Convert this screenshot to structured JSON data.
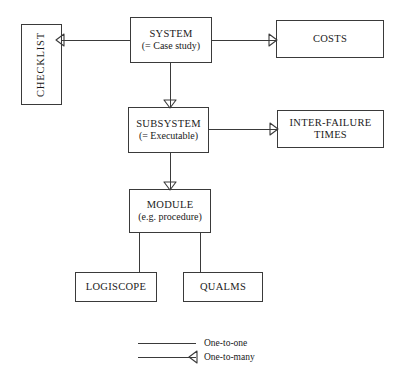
{
  "diagram": {
    "nodes": [
      {
        "id": "checklist",
        "label": "CHECKLIST",
        "sublabel": "",
        "orientation": "vertical",
        "x": 21,
        "y": 24,
        "w": 41,
        "h": 81
      },
      {
        "id": "system",
        "label": "SYSTEM",
        "sublabel": "(= Case study)",
        "orientation": "horizontal",
        "x": 130,
        "y": 17,
        "w": 82,
        "h": 46
      },
      {
        "id": "costs",
        "label": "COSTS",
        "sublabel": "",
        "orientation": "horizontal",
        "x": 276,
        "y": 20,
        "w": 108,
        "h": 38
      },
      {
        "id": "subsystem",
        "label": "SUBSYSTEM",
        "sublabel": "(= Executable)",
        "orientation": "horizontal",
        "x": 128,
        "y": 107,
        "w": 81,
        "h": 46
      },
      {
        "id": "inter-failure-times",
        "label": "INTER-FAILURE",
        "sublabel": "TIMES",
        "orientation": "horizontal",
        "x": 277,
        "y": 110,
        "w": 107,
        "h": 38
      },
      {
        "id": "module",
        "label": "MODULE",
        "sublabel": "(e.g. procedure)",
        "orientation": "horizontal",
        "x": 129,
        "y": 189,
        "w": 82,
        "h": 44
      },
      {
        "id": "logiscope",
        "label": "LOGISCOPE",
        "sublabel": "",
        "orientation": "horizontal",
        "x": 75,
        "y": 272,
        "w": 82,
        "h": 30
      },
      {
        "id": "qualms",
        "label": "QUALMS",
        "sublabel": "",
        "orientation": "horizontal",
        "x": 183,
        "y": 272,
        "w": 80,
        "h": 30
      }
    ],
    "edges": [
      {
        "id": "checklist-system",
        "from": "checklist",
        "to": "system",
        "kind": "one-to-many"
      },
      {
        "id": "system-costs",
        "from": "system",
        "to": "costs",
        "kind": "one-to-many"
      },
      {
        "id": "system-subsystem",
        "from": "system",
        "to": "subsystem",
        "kind": "one-to-many"
      },
      {
        "id": "subsystem-inter-failure-times",
        "from": "subsystem",
        "to": "inter-failure-times",
        "kind": "one-to-many"
      },
      {
        "id": "subsystem-module",
        "from": "subsystem",
        "to": "module",
        "kind": "one-to-many"
      },
      {
        "id": "module-logiscope",
        "from": "module",
        "to": "logiscope",
        "kind": "one-to-one"
      },
      {
        "id": "module-qualms",
        "from": "module",
        "to": "qualms",
        "kind": "one-to-one"
      }
    ],
    "legend": {
      "items": [
        {
          "id": "one-to-one",
          "label": "One-to-one",
          "kind": "one-to-one"
        },
        {
          "id": "one-to-many",
          "label": "One-to-many",
          "kind": "one-to-many"
        }
      ]
    },
    "colors": {
      "stroke": "#3a3a3a",
      "background": "#ffffff",
      "text": "#1a1a1a"
    }
  }
}
